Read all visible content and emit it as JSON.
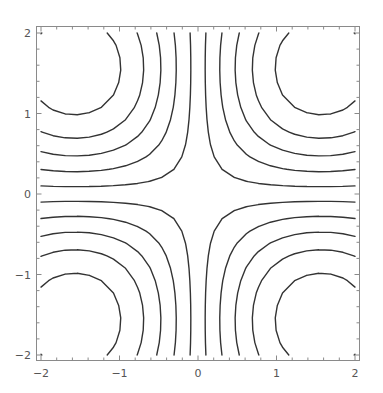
{
  "chart_data": {
    "type": "contour",
    "title": "",
    "xlabel": "",
    "ylabel": "",
    "function": "sin(x)*sin(y)",
    "xlim": [
      -2,
      2
    ],
    "ylim": [
      -2,
      2
    ],
    "levels": [
      -0.83,
      -0.636,
      -0.455,
      -0.273,
      -0.091,
      0.091,
      0.273,
      0.455,
      0.636,
      0.83
    ],
    "grid_points": 26,
    "x_ticks": [
      {
        "value": -2,
        "label": "-2"
      },
      {
        "value": -1,
        "label": "-1"
      },
      {
        "value": 0,
        "label": "0"
      },
      {
        "value": 1,
        "label": "1"
      },
      {
        "value": 2,
        "label": "2"
      }
    ],
    "y_ticks": [
      {
        "value": -2,
        "label": "-2"
      },
      {
        "value": -1,
        "label": "-1"
      },
      {
        "value": 0,
        "label": "0"
      },
      {
        "value": 1,
        "label": "1"
      },
      {
        "value": 2,
        "label": "2"
      }
    ],
    "minor_tick_step": 0.2,
    "grid": false,
    "legend": null,
    "line_color": "#333333",
    "frame_color": "#8a8a8a",
    "label_color": "#555555"
  }
}
